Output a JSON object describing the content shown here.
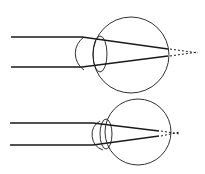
{
  "diagram": {
    "title": "",
    "panels": [
      {
        "name": "normal-eye",
        "description": "Parallel rays refracted by cornea and lens, focusing near retina"
      },
      {
        "name": "shorter-eye",
        "description": "Smaller eyeball; rays converge behind retina (dotted continuation)"
      }
    ],
    "colors": {
      "stroke": "#1a1a1a",
      "background": "#ffffff"
    }
  }
}
